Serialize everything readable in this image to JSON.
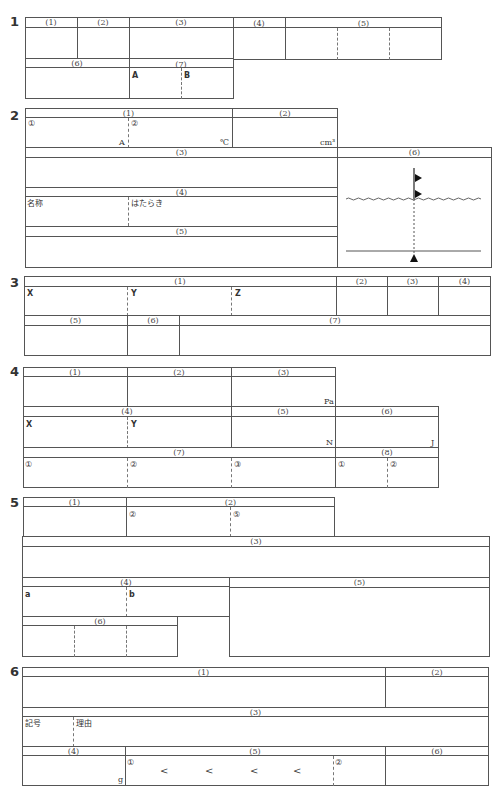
{
  "sheet": {
    "q1": {
      "number": "1",
      "headers": [
        "(1)",
        "(2)",
        "(3)",
        "(4)",
        "(5)",
        "(6)",
        "(7)"
      ],
      "q7_labels": [
        "A",
        "B"
      ]
    },
    "q2": {
      "number": "2",
      "headers": [
        "(1)",
        "(2)",
        "(3)",
        "(4)",
        "(5)",
        "(6)"
      ],
      "q1_labels": [
        "①",
        "②"
      ],
      "q1_units": [
        "A",
        "℃"
      ],
      "q2_unit": "cm³",
      "q4_labels": [
        "名称",
        "はたらき"
      ]
    },
    "q3": {
      "number": "3",
      "headers": [
        "(1)",
        "(2)",
        "(3)",
        "(4)",
        "(5)",
        "(6)",
        "(7)"
      ],
      "q1_labels": [
        "X",
        "Y",
        "Z"
      ]
    },
    "q4": {
      "number": "4",
      "headers": [
        "(1)",
        "(2)",
        "(3)",
        "(4)",
        "(5)",
        "(6)",
        "(7)",
        "(8)"
      ],
      "q3_unit": "Pa",
      "q4_labels": [
        "X",
        "Y"
      ],
      "q5_unit": "N",
      "q6_unit": "J",
      "q7_labels": [
        "①",
        "②",
        "③"
      ],
      "q8_labels": [
        "①",
        "②"
      ]
    },
    "q5": {
      "number": "5",
      "headers": [
        "(1)",
        "(2)",
        "(3)",
        "(4)",
        "(5)",
        "(6)"
      ],
      "q2_labels": [
        "②",
        "⑤"
      ],
      "q4_labels": [
        "a",
        "b"
      ]
    },
    "q6": {
      "number": "6",
      "headers": [
        "(1)",
        "(2)",
        "(3)",
        "(4)",
        "(5)",
        "(6)"
      ],
      "q3_labels": [
        "記号",
        "理由"
      ],
      "q4_unit": "g",
      "q5_labels": [
        "①",
        "②"
      ],
      "q5_separators": [
        "<",
        "<",
        "<",
        "<"
      ]
    }
  }
}
